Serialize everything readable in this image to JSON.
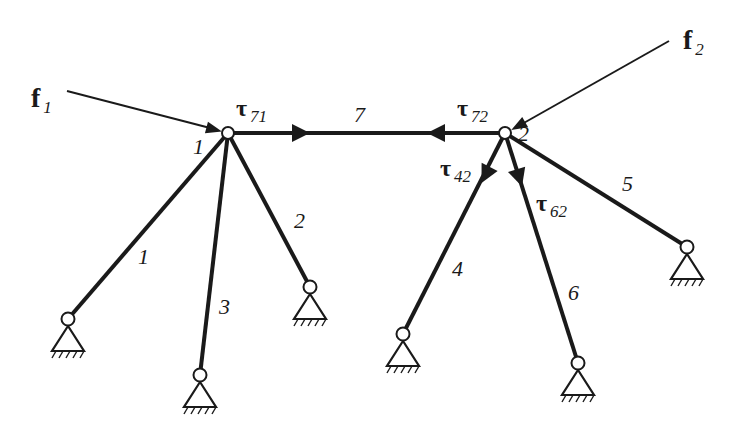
{
  "diagram": {
    "type": "pin-jointed truss / cable network with two free nodes",
    "colors": {
      "line": "#1a1a1a",
      "background": "#ffffff",
      "node_fill": "#ffffff"
    },
    "nodes": [
      {
        "id": "1",
        "label": "1",
        "x": 228,
        "y": 133
      },
      {
        "id": "2",
        "label": "2",
        "x": 505,
        "y": 133
      }
    ],
    "supports": [
      {
        "id": "S1",
        "x": 68,
        "y": 319
      },
      {
        "id": "S2",
        "x": 310,
        "y": 287
      },
      {
        "id": "S3",
        "x": 200,
        "y": 375
      },
      {
        "id": "S4",
        "x": 403,
        "y": 334
      },
      {
        "id": "S5",
        "x": 687,
        "y": 247
      },
      {
        "id": "S6",
        "x": 578,
        "y": 363
      }
    ],
    "members": [
      {
        "id": "1",
        "label": "1",
        "from": "node1",
        "to": "S1"
      },
      {
        "id": "2",
        "label": "2",
        "from": "node1",
        "to": "S2"
      },
      {
        "id": "3",
        "label": "3",
        "from": "node1",
        "to": "S3"
      },
      {
        "id": "4",
        "label": "4",
        "from": "node2",
        "to": "S4"
      },
      {
        "id": "5",
        "label": "5",
        "from": "node2",
        "to": "S5"
      },
      {
        "id": "6",
        "label": "6",
        "from": "node2",
        "to": "S6"
      },
      {
        "id": "7",
        "label": "7",
        "from": "node1",
        "to": "node2"
      }
    ],
    "forces": [
      {
        "id": "f1",
        "symbol": "f",
        "subscript": "1",
        "applied_at": "node1"
      },
      {
        "id": "f2",
        "symbol": "f",
        "subscript": "2",
        "applied_at": "node2"
      }
    ],
    "tensions": [
      {
        "id": "tau71",
        "symbol": "τ",
        "subscript": "71",
        "member": "7",
        "at_node": "1"
      },
      {
        "id": "tau72",
        "symbol": "τ",
        "subscript": "72",
        "member": "7",
        "at_node": "2"
      },
      {
        "id": "tau42",
        "symbol": "τ",
        "subscript": "42",
        "member": "4",
        "at_node": "2"
      },
      {
        "id": "tau62",
        "symbol": "τ",
        "subscript": "62",
        "member": "6",
        "at_node": "2"
      }
    ]
  },
  "labels": {
    "f1": {
      "symbol": "f",
      "sub": "1"
    },
    "f2": {
      "symbol": "f",
      "sub": "2"
    },
    "tau71": {
      "symbol": "τ",
      "sub": "71"
    },
    "tau72": {
      "symbol": "τ",
      "sub": "72"
    },
    "tau42": {
      "symbol": "τ",
      "sub": "42"
    },
    "tau62": {
      "symbol": "τ",
      "sub": "62"
    },
    "node1": "1",
    "node2": "2",
    "member1": "1",
    "member2": "2",
    "member3": "3",
    "member4": "4",
    "member5": "5",
    "member6": "6",
    "member7": "7"
  }
}
